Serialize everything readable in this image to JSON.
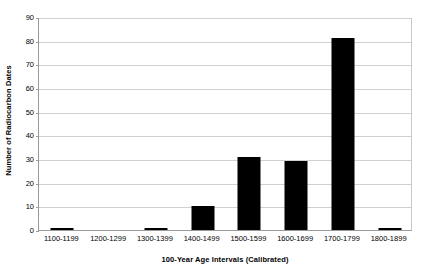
{
  "chart_data": {
    "type": "bar",
    "title": "",
    "subtitle": "",
    "xlabel": "100-Year Age Intervals (Calibrated)",
    "ylabel": "Number of Radiocarbon Dates",
    "categories": [
      "1100-1199",
      "1200-1299",
      "1300-1399",
      "1400-1499",
      "1500-1599",
      "1600-1699",
      "1700-1799",
      "1800-1899"
    ],
    "values": [
      1,
      0,
      1,
      10,
      31,
      29,
      81,
      1
    ],
    "ylim": [
      0,
      90
    ],
    "ytick_values": [
      0,
      10,
      20,
      30,
      40,
      50,
      60,
      70,
      80,
      90
    ],
    "ytick_labels": [
      "0",
      "10",
      "20",
      "30",
      "40",
      "50",
      "60",
      "70",
      "80",
      "90"
    ],
    "grid": true,
    "grid_axis": "y",
    "legend": false,
    "legend_position": "none",
    "bar_color": "#000000",
    "grid_color": "#d0d0d0",
    "axis_color": "#9a9a9a",
    "background_color": "#ffffff"
  }
}
